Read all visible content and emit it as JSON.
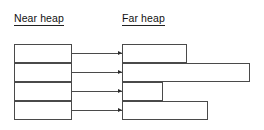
{
  "diagram": {
    "title_near": "Near heap",
    "title_far": "Far heap",
    "colors": {
      "box_stroke": "#4a4a4a",
      "arrow": "#2a2a2a",
      "text": "#111111",
      "background": "#ffffff"
    },
    "near_heap": {
      "label": "Near heap",
      "x": 14,
      "width": 58,
      "blocks": [
        {
          "name": "near-block-1",
          "y": 44,
          "height": 19
        },
        {
          "name": "near-block-2",
          "y": 63,
          "height": 19
        },
        {
          "name": "near-block-3",
          "y": 82,
          "height": 19
        },
        {
          "name": "near-block-4",
          "y": 101,
          "height": 19
        }
      ]
    },
    "far_heap": {
      "label": "Far heap",
      "x": 122,
      "blocks": [
        {
          "name": "far-block-1",
          "y": 44,
          "height": 19,
          "width": 65
        },
        {
          "name": "far-block-2",
          "y": 63,
          "height": 19,
          "width": 128
        },
        {
          "name": "far-block-3",
          "y": 82,
          "height": 19,
          "width": 41
        },
        {
          "name": "far-block-4",
          "y": 101,
          "height": 19,
          "width": 86
        }
      ]
    },
    "connectors": [
      {
        "name": "connector-1",
        "y": 53,
        "x_start": 72,
        "x_end": 122
      },
      {
        "name": "connector-2",
        "y": 72,
        "x_start": 72,
        "x_end": 122
      },
      {
        "name": "connector-3",
        "y": 91,
        "x_start": 72,
        "x_end": 122
      },
      {
        "name": "connector-4",
        "y": 110,
        "x_start": 72,
        "x_end": 122
      }
    ]
  }
}
